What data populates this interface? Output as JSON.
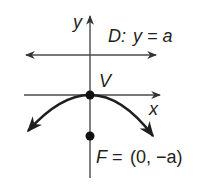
{
  "diagram": {
    "type": "parabola-focus-directrix",
    "labels": {
      "y_axis": "y",
      "x_axis": "x",
      "vertex": "V",
      "directrix_prefix": "D:",
      "directrix_eq": "y = a",
      "focus_prefix": "F =",
      "focus_coords": "(0, −a)"
    },
    "colors": {
      "line": "#4a4a4a",
      "curve": "#1f1f1f",
      "point": "#111111",
      "text": "#231f20"
    }
  }
}
